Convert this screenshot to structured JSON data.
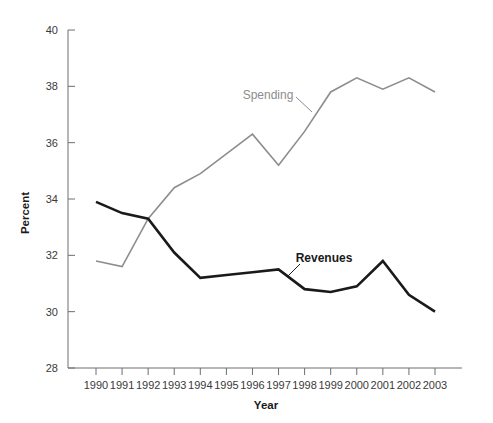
{
  "chart_data": {
    "type": "line",
    "title": "",
    "xlabel": "Year",
    "ylabel": "Percent",
    "x": [
      1990,
      1991,
      1992,
      1993,
      1994,
      1995,
      1996,
      1997,
      1998,
      1999,
      2000,
      2001,
      2002,
      2003
    ],
    "categories": [
      "1990",
      "1991",
      "1992",
      "1993",
      "1994",
      "1995",
      "1996",
      "1997",
      "1998",
      "1999",
      "2000",
      "2001",
      "2002",
      "2003"
    ],
    "xlim": [
      1990,
      2003
    ],
    "ylim": [
      28,
      40
    ],
    "yticks": [
      28,
      30,
      32,
      34,
      36,
      38,
      40
    ],
    "ytick_labels": [
      "28",
      "30",
      "32",
      "34",
      "36",
      "38",
      "40"
    ],
    "grid": false,
    "legend_position": "inline-annotations",
    "series": [
      {
        "name": "Spending",
        "color": "#8d8d8d",
        "width": 1.6,
        "values": [
          31.8,
          31.6,
          33.3,
          34.4,
          34.9,
          35.6,
          36.3,
          35.2,
          36.4,
          37.8,
          38.3,
          37.9,
          38.3,
          37.8
        ]
      },
      {
        "name": "Revenues",
        "color": "#1a1a1a",
        "width": 2.6,
        "values": [
          33.9,
          33.5,
          33.3,
          32.1,
          31.2,
          31.3,
          31.4,
          31.5,
          30.8,
          30.7,
          30.9,
          31.8,
          30.6,
          30.0
        ]
      }
    ],
    "annotations": [
      {
        "text": "Spending",
        "series": "Spending",
        "label_x": 268,
        "label_y": 99,
        "leader_from_x": 296,
        "leader_from_y": 97,
        "leader_to_x": 312,
        "leader_to_y": 112
      },
      {
        "text": "Revenues",
        "series": "Revenues",
        "label_x": 324,
        "label_y": 262,
        "leader_from_x": 300,
        "leader_from_y": 264,
        "leader_to_x": 288,
        "leader_to_y": 276
      }
    ]
  },
  "colors": {
    "spending": "#8d8d8d",
    "revenues": "#1a1a1a",
    "axis": "#6e6e6e",
    "tick_text": "#3a3a3a",
    "background": "#ffffff"
  }
}
